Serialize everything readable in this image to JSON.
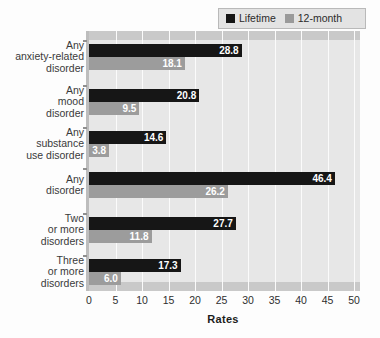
{
  "legend": {
    "position": "top-right",
    "entries": [
      {
        "label": "Lifetime",
        "color": "#161616",
        "swatch": "square-icon"
      },
      {
        "label": "12-month",
        "color": "#9c9c9c",
        "swatch": "square-icon"
      }
    ]
  },
  "axis": {
    "x_title": "Rates",
    "x_ticks": [
      "0",
      "5",
      "10",
      "15",
      "20",
      "25",
      "30",
      "35",
      "40",
      "45",
      "50"
    ]
  },
  "chart_data": {
    "type": "bar",
    "orientation": "horizontal",
    "title": "",
    "subtitle": "",
    "xlabel": "Rates",
    "ylabel": "",
    "xlim": [
      0,
      50
    ],
    "xticks": [
      0,
      5,
      10,
      15,
      20,
      25,
      30,
      35,
      40,
      45,
      50
    ],
    "grid": true,
    "grid_axis": "x",
    "legend_position": "top-right",
    "categories": [
      "Any anxiety-related disorder",
      "Any mood disorder",
      "Any substance use disorder",
      "Any disorder",
      "Two or more disorders",
      "Three or more disorders"
    ],
    "category_lines": [
      [
        "Any",
        "anxiety-related",
        "disorder"
      ],
      [
        "Any",
        "mood",
        "disorder"
      ],
      [
        "Any",
        "substance",
        "use disorder"
      ],
      [
        "Any",
        "disorder"
      ],
      [
        "Two",
        "or more",
        "disorders"
      ],
      [
        "Three",
        "or more",
        "disorders"
      ]
    ],
    "series": [
      {
        "name": "Lifetime",
        "color": "#161616",
        "values": [
          28.8,
          20.8,
          14.6,
          46.4,
          27.7,
          17.3
        ],
        "labels": [
          "28.8",
          "20.8",
          "14.6",
          "46.4",
          "27.7",
          "17.3"
        ]
      },
      {
        "name": "12-month",
        "color": "#9c9c9c",
        "values": [
          18.1,
          9.5,
          3.8,
          26.2,
          11.8,
          6.0
        ],
        "labels": [
          "18.1",
          "9.5",
          "3.8",
          "26.2",
          "11.8",
          "6.0"
        ]
      }
    ]
  },
  "colors": {
    "lifetime": "#161616",
    "twelve_month": "#9c9c9c",
    "plot_background": "#e7e7e7",
    "gridline": "#fbfbfb",
    "band": "#c9c9c9"
  }
}
